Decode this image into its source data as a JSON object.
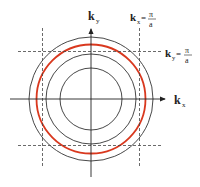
{
  "diagram": {
    "type": "fermi-circle-brillouin-zone",
    "colors": {
      "circle": "#333333",
      "fermi_circle": "#d9381e",
      "axis": "#222222",
      "dashed": "#444444",
      "background": "#ffffff"
    },
    "axes": {
      "x_label": "k",
      "x_sub": "x",
      "y_label": "k",
      "y_sub": "y"
    },
    "boundary_labels": [
      {
        "var": "k",
        "sub": "x",
        "eq": "=",
        "num": "π",
        "den": "a"
      },
      {
        "var": "k",
        "sub": "y",
        "eq": "=",
        "num": "π",
        "den": "a"
      }
    ],
    "circles": [
      {
        "name": "inner",
        "r": 31
      },
      {
        "name": "middle",
        "r": 45
      },
      {
        "name": "fermi",
        "r": 55,
        "highlight": true
      },
      {
        "name": "outer",
        "r": 62
      }
    ]
  }
}
